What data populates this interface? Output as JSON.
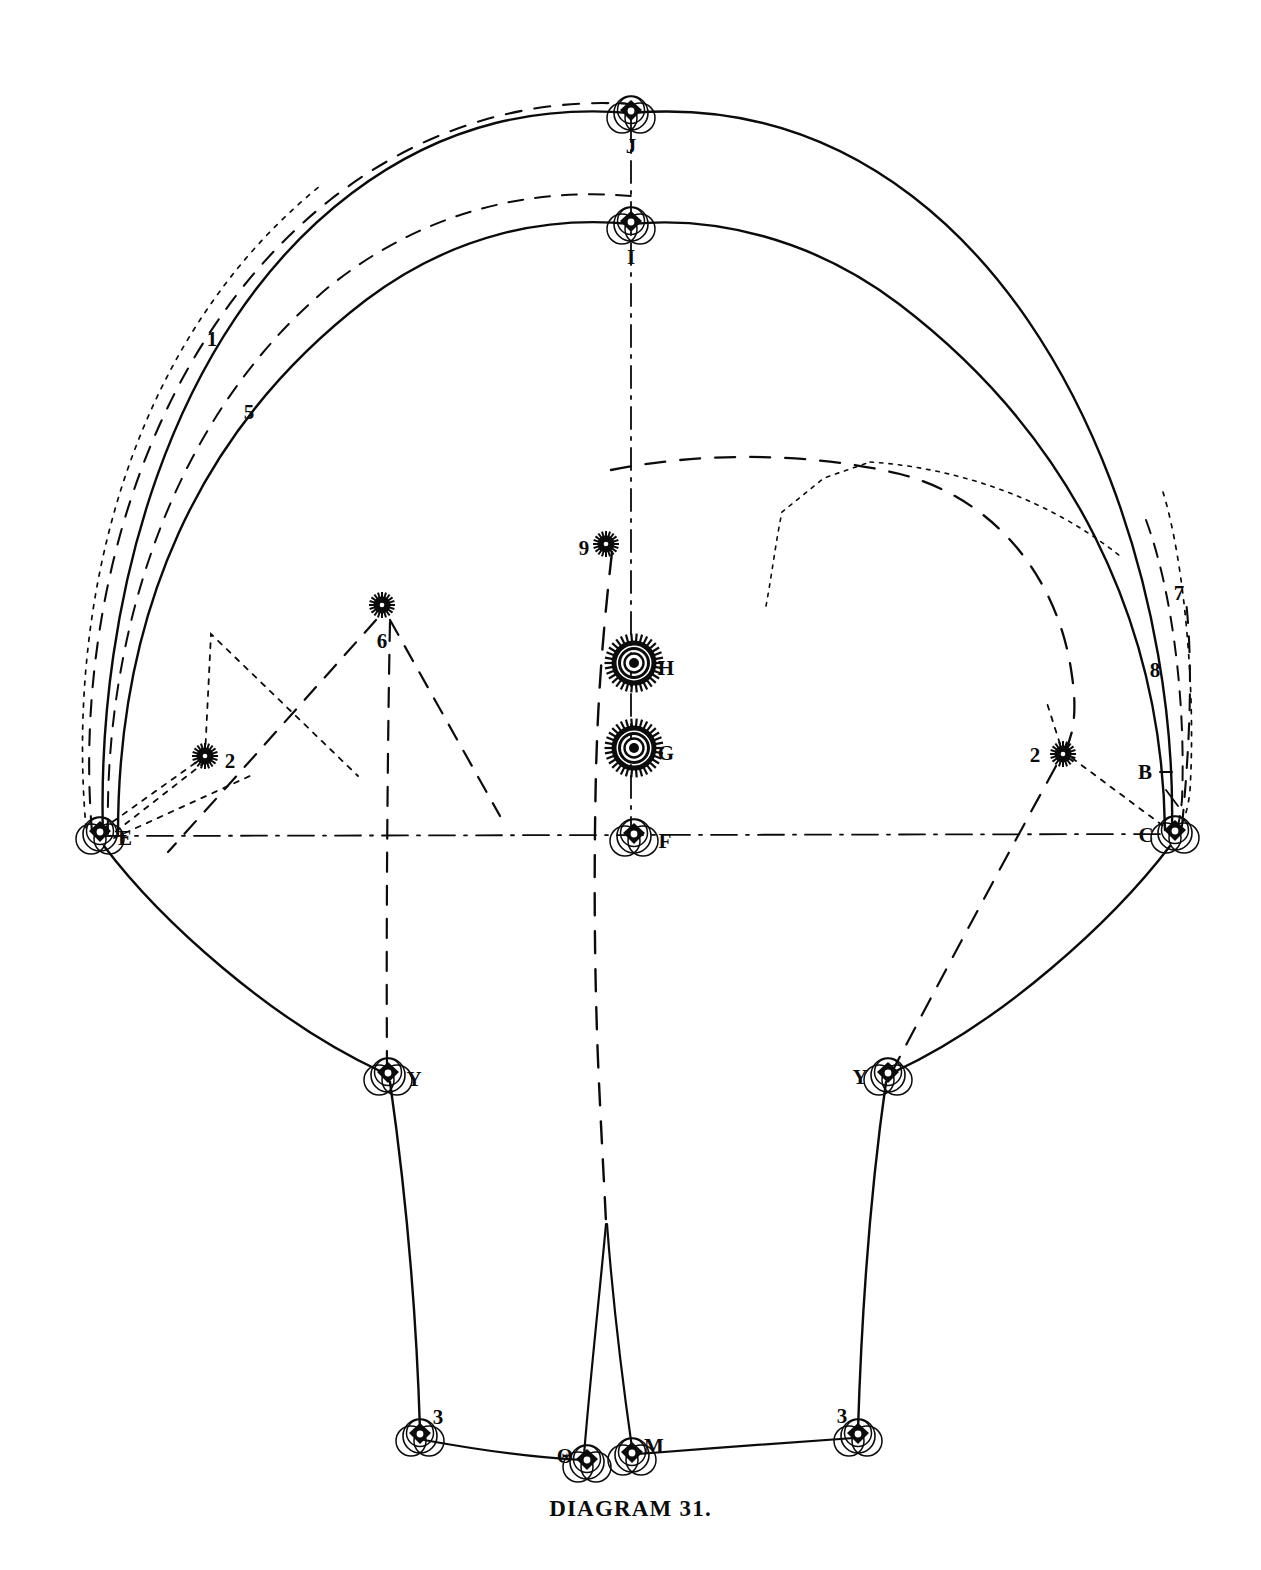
{
  "figure": {
    "caption": "DIAGRAM 31.",
    "title": "Diagram 31",
    "ink_color": "#0b0b0b",
    "background_color": "#ffffff"
  },
  "labels": {
    "apex_outer": "J",
    "apex_inner": "I",
    "arc_outer_number": "1",
    "arc_inner_number": "5",
    "right_upper_number": "7",
    "right_lower_number": "8",
    "left_star_number": "6",
    "center_star_number": "9",
    "left_mid_number": "2",
    "right_mid_number": "2",
    "hub_upper": "H",
    "hub_lower": "G",
    "axis_center": "F",
    "left_anchor": "E",
    "right_anchor": "C",
    "right_tick": "B",
    "left_knee": "Y",
    "right_knee": "Y",
    "left_foot_number": "3",
    "right_foot_number": "3",
    "foot_left_center": "Θ",
    "foot_right_center": "M"
  },
  "nodes": [
    {
      "name": "node-J",
      "label": "J",
      "x": 631,
      "y": 113,
      "kind": "ring-pulley",
      "label_dx": 0,
      "label_dy": 35
    },
    {
      "name": "node-I",
      "label": "I",
      "x": 631,
      "y": 224,
      "kind": "ring-pulley",
      "label_dx": 0,
      "label_dy": 35
    },
    {
      "name": "node-star-9",
      "label": "9",
      "x": 606,
      "y": 544,
      "kind": "small-star",
      "label_dx": -22,
      "label_dy": 6
    },
    {
      "name": "node-star-6",
      "label": "6",
      "x": 382,
      "y": 605,
      "kind": "small-star",
      "label_dx": 0,
      "label_dy": 38
    },
    {
      "name": "node-H",
      "label": "H",
      "x": 634,
      "y": 663,
      "kind": "gear-hub",
      "label_dx": 32,
      "label_dy": 7
    },
    {
      "name": "node-G",
      "label": "G",
      "x": 634,
      "y": 748,
      "kind": "gear-hub",
      "label_dx": 32,
      "label_dy": 7
    },
    {
      "name": "node-left-2",
      "label": "2",
      "x": 205,
      "y": 756,
      "kind": "small-star",
      "label_dx": 25,
      "label_dy": 7
    },
    {
      "name": "node-right-2",
      "label": "2",
      "x": 1063,
      "y": 754,
      "kind": "small-star",
      "label_dx": -28,
      "label_dy": 3
    },
    {
      "name": "node-F",
      "label": "F",
      "x": 634,
      "y": 836,
      "kind": "ring-pulley",
      "label_dx": 31,
      "label_dy": 7
    },
    {
      "name": "node-E",
      "label": "E",
      "x": 100,
      "y": 834,
      "kind": "ring-pulley",
      "label_dx": 25,
      "label_dy": 6
    },
    {
      "name": "node-C",
      "label": "C",
      "x": 1175,
      "y": 833,
      "kind": "ring-pulley",
      "label_dx": -29,
      "label_dy": 4
    },
    {
      "name": "node-Y-left",
      "label": "Y",
      "x": 388,
      "y": 1075,
      "kind": "ring-pulley",
      "label_dx": 26,
      "label_dy": 6
    },
    {
      "name": "node-Y-right",
      "label": "Y",
      "x": 888,
      "y": 1075,
      "kind": "ring-pulley",
      "label_dx": -28,
      "label_dy": 4
    },
    {
      "name": "node-foot-left",
      "label": "3",
      "x": 420,
      "y": 1436,
      "kind": "ring-pulley",
      "label_dx": 18,
      "label_dy": -17
    },
    {
      "name": "node-foot-right",
      "label": "3",
      "x": 858,
      "y": 1436,
      "kind": "ring-pulley",
      "label_dx": -16,
      "label_dy": -18
    },
    {
      "name": "node-theta",
      "label": "Θ",
      "x": 587,
      "y": 1462,
      "kind": "ring-pulley",
      "label_dx": -22,
      "label_dy": -4
    },
    {
      "name": "node-M",
      "label": "M",
      "x": 632,
      "y": 1455,
      "kind": "ring-pulley",
      "label_dx": 22,
      "label_dy": -7
    }
  ],
  "annotations": [
    {
      "name": "annot-1",
      "text": "1",
      "x": 212,
      "y": 341
    },
    {
      "name": "annot-5",
      "text": "5",
      "x": 249,
      "y": 414
    },
    {
      "name": "annot-7",
      "text": "7",
      "x": 1179,
      "y": 595
    },
    {
      "name": "annot-8",
      "text": "8",
      "x": 1155,
      "y": 672
    },
    {
      "name": "annot-B",
      "text": "B",
      "x": 1145,
      "y": 774
    }
  ],
  "strokes": {
    "solid": "solid",
    "dashed_long": "long-dash",
    "dashed_short": "short-dash",
    "dotted": "dotted",
    "dash_dot": "dash-dot"
  }
}
